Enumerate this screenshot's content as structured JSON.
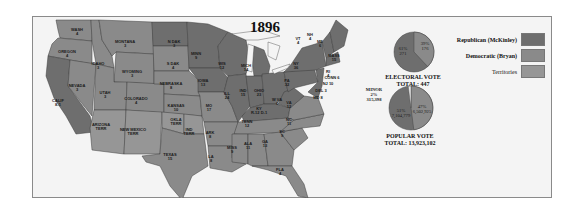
{
  "title": "1896",
  "colors": {
    "republican": "#6e6e6e",
    "democratic": "#8a8a8a",
    "territories": "#969696",
    "water": "#f4f4f4",
    "border": "#3c3c3c"
  },
  "legend": [
    {
      "label": "Republican (McKinley)",
      "key": "republican"
    },
    {
      "label": "Democratic (Bryan)",
      "key": "democratic"
    },
    {
      "label": "Territories",
      "key": "territories"
    }
  ],
  "electoral_vote": {
    "caption": "ELECTORAL VOTE",
    "total": "TOTAL: 447",
    "republican": {
      "pct": "61%",
      "votes": "271"
    },
    "democratic": {
      "pct": "39%",
      "votes": "176"
    }
  },
  "popular_vote": {
    "caption": "POPULAR VOTE",
    "total": "TOTAL: 13,923,102",
    "republican": {
      "pct": "51%",
      "votes": "7,104,779"
    },
    "democratic": {
      "pct": "47%",
      "votes": "6,502,925"
    },
    "minor": {
      "label": "MINOR",
      "pct": "2%",
      "votes": "315,398"
    }
  },
  "states": [
    {
      "name": "WASH",
      "ev": "4"
    },
    {
      "name": "OREGON",
      "ev": "4"
    },
    {
      "name": "CALIF",
      "ev": "8-1"
    },
    {
      "name": "NEVADA",
      "ev": "3"
    },
    {
      "name": "IDAHO",
      "ev": "3"
    },
    {
      "name": "MONTANA",
      "ev": "3"
    },
    {
      "name": "WYOMING",
      "ev": "3"
    },
    {
      "name": "UTAH",
      "ev": "3"
    },
    {
      "name": "COLORADO",
      "ev": "4"
    },
    {
      "name": "ARIZONA",
      "ev": "TERR"
    },
    {
      "name": "NEW MEXICO",
      "ev": "TERR"
    },
    {
      "name": "N DAK",
      "ev": "3"
    },
    {
      "name": "S DAK",
      "ev": "4"
    },
    {
      "name": "NEBRASKA",
      "ev": "8"
    },
    {
      "name": "KANSAS",
      "ev": "10"
    },
    {
      "name": "OKLA",
      "ev": "TERR"
    },
    {
      "name": "IND",
      "ev": "TERR"
    },
    {
      "name": "TEXAS",
      "ev": "15"
    },
    {
      "name": "MINN",
      "ev": "9"
    },
    {
      "name": "IOWA",
      "ev": "13"
    },
    {
      "name": "MO",
      "ev": "17"
    },
    {
      "name": "ARK",
      "ev": "8"
    },
    {
      "name": "LA",
      "ev": "8"
    },
    {
      "name": "WIS",
      "ev": "12"
    },
    {
      "name": "ILL",
      "ev": "24"
    },
    {
      "name": "MICH",
      "ev": "14"
    },
    {
      "name": "IND",
      "ev": "15"
    },
    {
      "name": "OHIO",
      "ev": "23"
    },
    {
      "name": "KY",
      "ev": "R-12 D-1"
    },
    {
      "name": "TENN",
      "ev": "12"
    },
    {
      "name": "MISS",
      "ev": "9"
    },
    {
      "name": "ALA",
      "ev": "11"
    },
    {
      "name": "GA",
      "ev": "13"
    },
    {
      "name": "FLA",
      "ev": "4"
    },
    {
      "name": "SC",
      "ev": "9"
    },
    {
      "name": "NC",
      "ev": "11"
    },
    {
      "name": "VA",
      "ev": "12"
    },
    {
      "name": "W VA",
      "ev": "6"
    },
    {
      "name": "PA",
      "ev": "32"
    },
    {
      "name": "NY",
      "ev": "36"
    },
    {
      "name": "VT",
      "ev": "4"
    },
    {
      "name": "NH",
      "ev": "4"
    },
    {
      "name": "ME",
      "ev": "6"
    },
    {
      "name": "MASS",
      "ev": "15"
    },
    {
      "name": "RI",
      "ev": "4"
    },
    {
      "name": "CONN",
      "ev": "6"
    },
    {
      "name": "NJ",
      "ev": "10"
    },
    {
      "name": "DEL",
      "ev": "3"
    },
    {
      "name": "MD",
      "ev": "8"
    },
    {
      "name": "OKLA",
      "ev": "D.T."
    }
  ]
}
